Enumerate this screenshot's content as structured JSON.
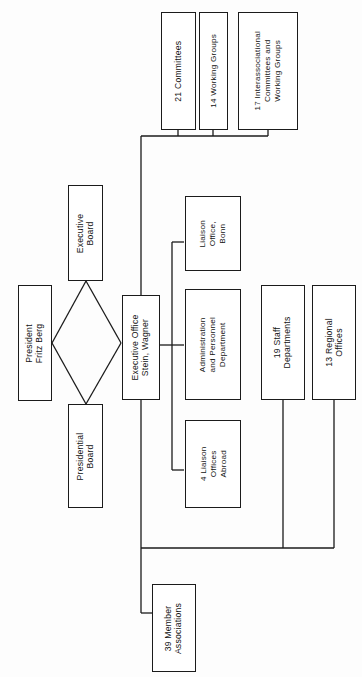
{
  "document": {
    "kind": "organizational-chart",
    "orientation": "rotated-90-counterclockwise"
  },
  "nodes": {
    "president": {
      "label": "President\nFritz Berg"
    },
    "executive_board": {
      "label": "Executive\nBoard"
    },
    "presidential_board": {
      "label": "Presidential\nBoard"
    },
    "executive_office": {
      "label": "Executive Office\nStein, Wagner"
    },
    "committees_21": {
      "label": "21 Committees"
    },
    "working_groups_14": {
      "label": "14 Working Groups"
    },
    "interassociational_17": {
      "label": "17 Interassociational\nCommittees and\nWorking Groups"
    },
    "liaison_office_bonn": {
      "label": "Liaison\nOffice,\nBonn"
    },
    "admin_personnel": {
      "label": "Administration\nand Personnel\nDepartment"
    },
    "liaison_offices_abroad_4": {
      "label": "4 Liaison\nOffices\nAbroad"
    },
    "staff_departments_19": {
      "label": "19 Staff\nDepartments"
    },
    "regional_offices_13": {
      "label": "13 Regional\nOffices"
    },
    "member_associations_39": {
      "label": "39 Member\nAssociations"
    }
  },
  "colors": {
    "line": "#1b1b1b",
    "box_fill": "#ffffff",
    "text": "#121212",
    "background": "#fdfdfd"
  }
}
